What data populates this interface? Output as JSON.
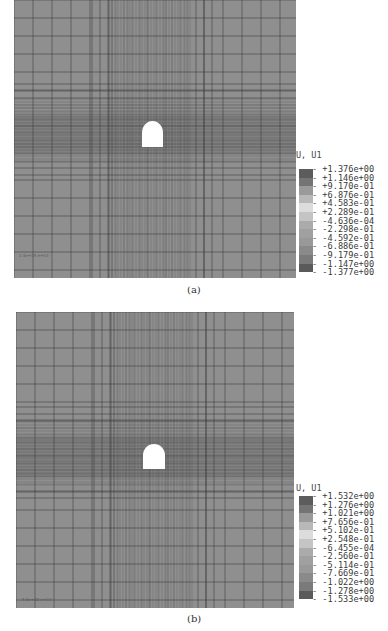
{
  "figures": [
    {
      "id": "a",
      "caption": "(a)",
      "mesh_label": "2.4e+05 e+03",
      "legend": {
        "title": "U, U1",
        "values": [
          "+1.376e+00",
          "+1.146e+00",
          "+9.170e-01",
          "+6.876e-01",
          "+4.583e-01",
          "+2.289e-01",
          "-4.636e-04",
          "-2.298e-01",
          "-4.592e-01",
          "-6.886e-01",
          "-9.179e-01",
          "-1.147e+00",
          "-1.377e+00"
        ],
        "swatch_colors": [
          "#5c5c5c",
          "#747474",
          "#9a9a9a",
          "#b8b8b8",
          "#dcdcdc",
          "#c4c4c4",
          "#ababab",
          "#a0a0a0",
          "#999999",
          "#8a8a8a",
          "#7a7a7a",
          "#5a5a5a",
          "#3c3c3c"
        ]
      }
    },
    {
      "id": "b",
      "caption": "(b)",
      "mesh_label": "5.6e+05 e+03",
      "legend": {
        "title": "U, U1",
        "values": [
          "+1.532e+00",
          "+1.276e+00",
          "+1.021e+00",
          "+7.656e-01",
          "+5.102e-01",
          "+2.548e-01",
          "-6.455e-04",
          "-2.560e-01",
          "-5.114e-01",
          "-7.669e-01",
          "-1.022e+00",
          "-1.278e+00",
          "-1.533e+00"
        ],
        "swatch_colors": [
          "#5c5c5c",
          "#747474",
          "#9a9a9a",
          "#b8b8b8",
          "#dcdcdc",
          "#c4c4c4",
          "#ababab",
          "#a0a0a0",
          "#999999",
          "#8a8a8a",
          "#7a7a7a",
          "#5a5a5a",
          "#3c3c3c"
        ]
      }
    }
  ]
}
